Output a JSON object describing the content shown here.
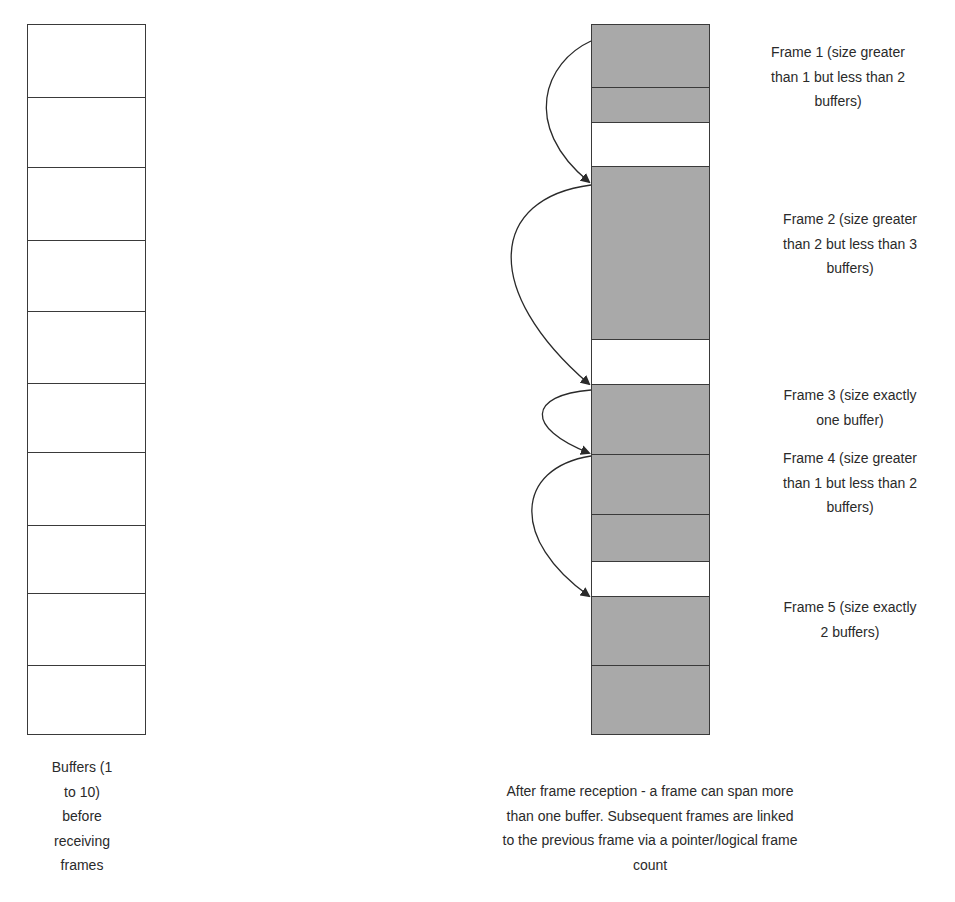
{
  "colors": {
    "filled": "#a9a9a9",
    "empty": "#ffffff",
    "border": "#3a3a3a",
    "text": "#2a2a2a"
  },
  "left_column": {
    "label_lines": [
      "Buffers (1",
      "to 10)",
      "before",
      "receiving",
      "frames"
    ],
    "buffers": [
      {
        "top": 0,
        "height": 73
      },
      {
        "top": 73,
        "height": 70
      },
      {
        "top": 143,
        "height": 73
      },
      {
        "top": 216,
        "height": 71
      },
      {
        "top": 287,
        "height": 72
      },
      {
        "top": 359,
        "height": 69
      },
      {
        "top": 428,
        "height": 73
      },
      {
        "top": 501,
        "height": 68
      },
      {
        "top": 569,
        "height": 72
      },
      {
        "top": 641,
        "height": 69
      }
    ]
  },
  "right_column": {
    "caption_lines": [
      "After frame reception - a frame can span more",
      "than one buffer. Subsequent frames are linked",
      "to the previous frame via a pointer/logical frame",
      "count"
    ],
    "segments": [
      {
        "top": 0,
        "height": 63,
        "filled": true,
        "frame": 1
      },
      {
        "top": 63,
        "height": 35,
        "filled": true,
        "frame": 1
      },
      {
        "top": 98,
        "height": 44,
        "filled": false,
        "frame": 1
      },
      {
        "top": 142,
        "height": 173,
        "filled": true,
        "frame": 2
      },
      {
        "top": 315,
        "height": 45,
        "filled": false,
        "frame": 2
      },
      {
        "top": 360,
        "height": 70,
        "filled": true,
        "frame": 3
      },
      {
        "top": 430,
        "height": 60,
        "filled": true,
        "frame": 4
      },
      {
        "top": 490,
        "height": 47,
        "filled": true,
        "frame": 4
      },
      {
        "top": 537,
        "height": 35,
        "filled": false,
        "frame": 4
      },
      {
        "top": 572,
        "height": 69,
        "filled": true,
        "frame": 5
      },
      {
        "top": 641,
        "height": 69,
        "filled": true,
        "frame": 5
      }
    ]
  },
  "frames": [
    {
      "id": 1,
      "lines": [
        "Frame 1 (size greater",
        "than 1 but less than 2",
        "buffers)"
      ]
    },
    {
      "id": 2,
      "lines": [
        "Frame 2 (size greater",
        "than 2 but less than 3",
        "buffers)"
      ]
    },
    {
      "id": 3,
      "lines": [
        "Frame 3 (size exactly",
        "one buffer)"
      ]
    },
    {
      "id": 4,
      "lines": [
        "Frame 4 (size greater",
        "than 1 but less than 2",
        "buffers)"
      ]
    },
    {
      "id": 5,
      "lines": [
        "Frame 5 (size exactly",
        "2 buffers)"
      ]
    }
  ],
  "links": [
    {
      "from_frame": 1,
      "to_frame": 2
    },
    {
      "from_frame": 2,
      "to_frame": 3
    },
    {
      "from_frame": 3,
      "to_frame": 4
    },
    {
      "from_frame": 4,
      "to_frame": 5
    }
  ]
}
